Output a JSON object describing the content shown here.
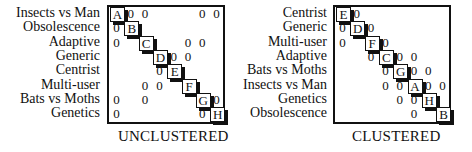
{
  "unclustered": {
    "caption": "UNCLUSTERED",
    "rows": [
      {
        "label": "Insects vs Man",
        "code": "A"
      },
      {
        "label": "Obsolescence",
        "code": "B"
      },
      {
        "label": "Adaptive",
        "code": "C"
      },
      {
        "label": "Generic",
        "code": "D"
      },
      {
        "label": "Centrist",
        "code": "E"
      },
      {
        "label": "Multi-user",
        "code": "F"
      },
      {
        "label": "Bats vs Moths",
        "code": "G"
      },
      {
        "label": "Genetics",
        "code": "H"
      }
    ],
    "zeros": [
      [
        0,
        1
      ],
      [
        0,
        2
      ],
      [
        0,
        6
      ],
      [
        0,
        7
      ],
      [
        1,
        0
      ],
      [
        2,
        0
      ],
      [
        2,
        5
      ],
      [
        2,
        6
      ],
      [
        3,
        4
      ],
      [
        3,
        5
      ],
      [
        4,
        3
      ],
      [
        5,
        2
      ],
      [
        5,
        3
      ],
      [
        6,
        0
      ],
      [
        6,
        2
      ],
      [
        6,
        7
      ],
      [
        7,
        0
      ],
      [
        7,
        6
      ]
    ],
    "zero_symbol": "0"
  },
  "clustered": {
    "caption": "CLUSTERED",
    "rows": [
      {
        "label": "Centrist",
        "code": "E"
      },
      {
        "label": "Generic",
        "code": "D"
      },
      {
        "label": "Multi-user",
        "code": "F"
      },
      {
        "label": "Adaptive",
        "code": "C"
      },
      {
        "label": "Bats vs Moths",
        "code": "G"
      },
      {
        "label": "Insects vs Man",
        "code": "A"
      },
      {
        "label": "Genetics",
        "code": "H"
      },
      {
        "label": "Obsolescence",
        "code": "B"
      }
    ],
    "zeros": [
      [
        0,
        1
      ],
      [
        1,
        0
      ],
      [
        1,
        2
      ],
      [
        2,
        0
      ],
      [
        2,
        3
      ],
      [
        3,
        2
      ],
      [
        3,
        4
      ],
      [
        3,
        5
      ],
      [
        4,
        3
      ],
      [
        4,
        5
      ],
      [
        4,
        6
      ],
      [
        5,
        3
      ],
      [
        5,
        4
      ],
      [
        5,
        6
      ],
      [
        5,
        7
      ],
      [
        6,
        4
      ],
      [
        6,
        5
      ],
      [
        7,
        5
      ]
    ],
    "zero_symbol": "0"
  }
}
